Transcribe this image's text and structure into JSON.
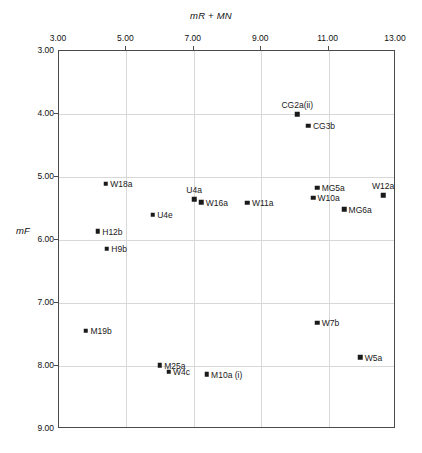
{
  "chart_data": {
    "type": "scatter",
    "title": "",
    "xlabel": "mR + MN",
    "ylabel": "mF",
    "xlim": [
      3.0,
      13.0
    ],
    "ylim": [
      9.0,
      3.0
    ],
    "y_axis_inverted": true,
    "x_ticks": [
      "3.00",
      "5.00",
      "7.00",
      "9.00",
      "11.00",
      "13.00"
    ],
    "x_tick_values": [
      3.0,
      5.0,
      7.0,
      9.0,
      11.0,
      13.0
    ],
    "y_ticks": [
      "3.00",
      "4.00",
      "5.00",
      "6.00",
      "7.00",
      "8.00",
      "9.00"
    ],
    "y_tick_values": [
      3.0,
      4.0,
      5.0,
      6.0,
      7.0,
      8.0,
      9.0
    ],
    "x_axis_position": "top",
    "y_axis_position": "left",
    "grid": true,
    "legend": "none",
    "marker": "square",
    "marker_color": "#1a1a1a",
    "points": [
      {
        "label": "CG2a(ii)",
        "x": 10.07,
        "y": 4.0,
        "label_pos": "above"
      },
      {
        "label": "CG3b",
        "x": 10.4,
        "y": 4.19,
        "label_pos": "right"
      },
      {
        "label": "W18a",
        "x": 4.39,
        "y": 5.11,
        "label_pos": "right"
      },
      {
        "label": "MG5a",
        "x": 10.66,
        "y": 5.17,
        "label_pos": "right"
      },
      {
        "label": "W12a",
        "x": 12.62,
        "y": 5.29,
        "label_pos": "above"
      },
      {
        "label": "W10a",
        "x": 10.54,
        "y": 5.33,
        "label_pos": "right"
      },
      {
        "label": "U4a",
        "x": 7.01,
        "y": 5.35,
        "label_pos": "above"
      },
      {
        "label": "W16a",
        "x": 7.22,
        "y": 5.4,
        "label_pos": "right"
      },
      {
        "label": "W11a",
        "x": 8.59,
        "y": 5.41,
        "label_pos": "right"
      },
      {
        "label": "MG6a",
        "x": 11.46,
        "y": 5.51,
        "label_pos": "right"
      },
      {
        "label": "U4e",
        "x": 5.78,
        "y": 5.6,
        "label_pos": "right"
      },
      {
        "label": "H12b",
        "x": 4.15,
        "y": 5.86,
        "label_pos": "right"
      },
      {
        "label": "H9b",
        "x": 4.42,
        "y": 6.14,
        "label_pos": "right"
      },
      {
        "label": "M19b",
        "x": 3.8,
        "y": 7.44,
        "label_pos": "right"
      },
      {
        "label": "W7b",
        "x": 10.66,
        "y": 7.31,
        "label_pos": "right"
      },
      {
        "label": "W5a",
        "x": 11.94,
        "y": 7.86,
        "label_pos": "right"
      },
      {
        "label": "M25a",
        "x": 5.99,
        "y": 7.99,
        "label_pos": "right"
      },
      {
        "label": "W4c",
        "x": 6.25,
        "y": 8.09,
        "label_pos": "right"
      },
      {
        "label": "M10a (i)",
        "x": 7.38,
        "y": 8.13,
        "label_pos": "right"
      }
    ]
  },
  "figure": {
    "caption_remnant": ""
  }
}
